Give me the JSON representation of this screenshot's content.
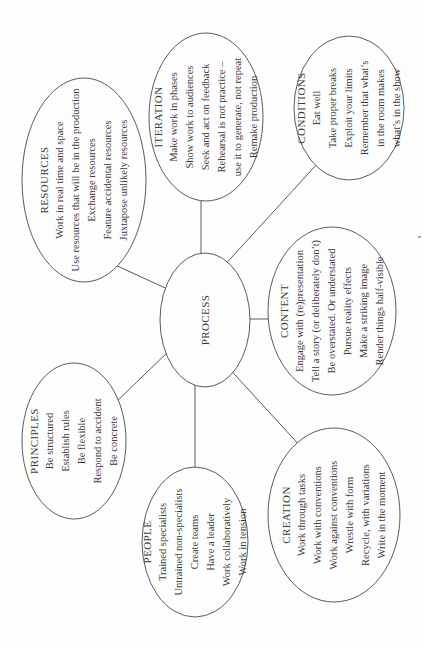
{
  "diagram": {
    "colors": {
      "paper": "#fdfdfd",
      "ink": "#3a3a3a",
      "line": "#5a5a5a"
    },
    "center": {
      "title": "PROCESS"
    },
    "nodes": {
      "resources": {
        "title": "RESOURCES",
        "lines": [
          "Work in real time and space",
          "Use resources that will be in the production",
          "Exchange resources",
          "Feature accidental resources",
          "Juxtapose unlikely resources"
        ]
      },
      "iteration": {
        "title": "ITERATION",
        "lines": [
          "Make work in phases",
          "Show work to audiences",
          "Seek and act on feedback",
          "Rehearsal is not practice –",
          "use it to generate, not repeat",
          "Remake production"
        ]
      },
      "conditions": {
        "title": "CONDITIONS",
        "lines": [
          "Eat well",
          "Take proper breaks",
          "Exploit your limits",
          "Remember that what’s",
          "in the room makes",
          "what’s in the show"
        ]
      },
      "content": {
        "title": "CONTENT",
        "lines": [
          "Engage with (re)presentation",
          "Tell a story (or deliberately don’t)",
          "Be overstated. Or understated",
          "Pursue reality effects",
          "Make a striking image",
          "Render things half-visible"
        ]
      },
      "principles": {
        "title": "PRINCIPLES",
        "lines": [
          "Be structured",
          "Establish rules",
          "Be flexible",
          "Respond to accident",
          "Be concrete"
        ]
      },
      "people": {
        "title": "PEOPLE",
        "lines": [
          "Trained specialists",
          "Untrained non-specialists",
          "Create teams",
          "Have a leader",
          "Work collaboratively",
          "Work in tension"
        ]
      },
      "creation": {
        "title": "CREATION",
        "lines": [
          "Work through tasks",
          "Work with conventions",
          "Work against conventions",
          "Wrestle with form",
          "Recycle, with variations",
          "Write in the moment"
        ]
      }
    }
  }
}
